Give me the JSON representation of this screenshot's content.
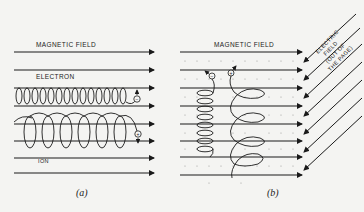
{
  "panel_a": {
    "field_label": "MAGNETIC   FIELD",
    "electron_label": "ELECTRON",
    "ion_label": "ION",
    "electron_charge": "−",
    "ion_charge": "+",
    "caption": "(a)"
  },
  "panel_b": {
    "field_label": "MAGNETIC   FIELD",
    "electric_label_1": "ELECTRIC",
    "electric_label_2": "FIELD",
    "electric_label_3": "(OUT OF",
    "electric_label_4": "THE PAGE)",
    "electron_charge": "−",
    "ion_charge": "+",
    "caption": "(b)"
  },
  "colors": {
    "ink": "#1a1a1a",
    "paper": "#f4f4f2",
    "dots": "#9a9a9a"
  }
}
